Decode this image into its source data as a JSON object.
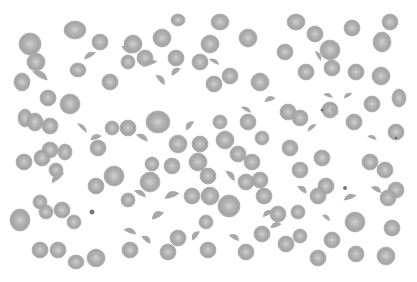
{
  "image": {
    "subject": "blood smear micrograph",
    "width": 417,
    "height": 282,
    "field": {
      "x": 15,
      "y": 14,
      "w": 389,
      "h": 254
    },
    "colors": {
      "background": "#ffffff",
      "cell": "#a8a8a8",
      "cell_edge": "#9a9a9a",
      "pallor": "#cfcfcf",
      "dark_dot": "#555555"
    }
  },
  "cells": [
    [
      30,
      44,
      11,
      11
    ],
    [
      75,
      30,
      11,
      9
    ],
    [
      100,
      42,
      8,
      8
    ],
    [
      133,
      44,
      9,
      9
    ],
    [
      162,
      38,
      9,
      9
    ],
    [
      178,
      20,
      7,
      6
    ],
    [
      210,
      44,
      9,
      9
    ],
    [
      220,
      22,
      9,
      8
    ],
    [
      248,
      38,
      9,
      9
    ],
    [
      296,
      22,
      9,
      8
    ],
    [
      315,
      34,
      8,
      8
    ],
    [
      330,
      50,
      10,
      10
    ],
    [
      352,
      28,
      8,
      8
    ],
    [
      382,
      42,
      9,
      10
    ],
    [
      390,
      22,
      8,
      8
    ],
    [
      22,
      82,
      8,
      9
    ],
    [
      36,
      62,
      9,
      9
    ],
    [
      48,
      98,
      8,
      8
    ],
    [
      78,
      70,
      8,
      7
    ],
    [
      110,
      82,
      8,
      8
    ],
    [
      128,
      62,
      7,
      7
    ],
    [
      145,
      58,
      8,
      8
    ],
    [
      176,
      58,
      8,
      8
    ],
    [
      200,
      62,
      8,
      8
    ],
    [
      214,
      84,
      8,
      8
    ],
    [
      230,
      76,
      8,
      8
    ],
    [
      260,
      82,
      9,
      9
    ],
    [
      285,
      52,
      8,
      8
    ],
    [
      306,
      72,
      8,
      8
    ],
    [
      332,
      68,
      8,
      8
    ],
    [
      356,
      72,
      8,
      8
    ],
    [
      381,
      76,
      9,
      9
    ],
    [
      399,
      98,
      7,
      9
    ],
    [
      70,
      104,
      10,
      10
    ],
    [
      25,
      118,
      7,
      9
    ],
    [
      35,
      122,
      8,
      9
    ],
    [
      50,
      126,
      8,
      8
    ],
    [
      50,
      150,
      8,
      8
    ],
    [
      65,
      152,
      7,
      8
    ],
    [
      98,
      148,
      8,
      8
    ],
    [
      112,
      128,
      7,
      7
    ],
    [
      128,
      128,
      8,
      8
    ],
    [
      158,
      122,
      12,
      11
    ],
    [
      178,
      144,
      9,
      9
    ],
    [
      200,
      144,
      8,
      8
    ],
    [
      220,
      122,
      7,
      7
    ],
    [
      225,
      140,
      9,
      9
    ],
    [
      248,
      122,
      8,
      8
    ],
    [
      262,
      138,
      7,
      7
    ],
    [
      288,
      112,
      8,
      8
    ],
    [
      300,
      118,
      8,
      8
    ],
    [
      330,
      110,
      8,
      8
    ],
    [
      354,
      122,
      8,
      8
    ],
    [
      372,
      104,
      8,
      8
    ],
    [
      396,
      132,
      8,
      8
    ],
    [
      24,
      162,
      8,
      8
    ],
    [
      42,
      158,
      8,
      8
    ],
    [
      56,
      170,
      7,
      7
    ],
    [
      114,
      176,
      10,
      10
    ],
    [
      152,
      164,
      7,
      7
    ],
    [
      172,
      166,
      8,
      8
    ],
    [
      198,
      162,
      9,
      9
    ],
    [
      208,
      176,
      8,
      8
    ],
    [
      238,
      154,
      8,
      8
    ],
    [
      252,
      162,
      8,
      8
    ],
    [
      260,
      180,
      8,
      8
    ],
    [
      290,
      148,
      8,
      8
    ],
    [
      300,
      170,
      8,
      8
    ],
    [
      322,
      158,
      8,
      8
    ],
    [
      326,
      186,
      8,
      8
    ],
    [
      370,
      162,
      8,
      8
    ],
    [
      385,
      170,
      8,
      8
    ],
    [
      396,
      190,
      8,
      8
    ],
    [
      20,
      220,
      10,
      11
    ],
    [
      40,
      202,
      7,
      7
    ],
    [
      46,
      212,
      7,
      7
    ],
    [
      62,
      210,
      8,
      8
    ],
    [
      74,
      222,
      7,
      7
    ],
    [
      96,
      186,
      8,
      8
    ],
    [
      128,
      200,
      7,
      7
    ],
    [
      150,
      182,
      10,
      10
    ],
    [
      192,
      196,
      8,
      8
    ],
    [
      210,
      196,
      9,
      9
    ],
    [
      229,
      206,
      11,
      11
    ],
    [
      246,
      182,
      8,
      8
    ],
    [
      264,
      196,
      8,
      8
    ],
    [
      278,
      214,
      8,
      8
    ],
    [
      298,
      212,
      7,
      7
    ],
    [
      318,
      196,
      8,
      8
    ],
    [
      355,
      222,
      10,
      10
    ],
    [
      388,
      198,
      8,
      8
    ],
    [
      392,
      228,
      8,
      8
    ],
    [
      40,
      250,
      8,
      8
    ],
    [
      58,
      250,
      8,
      8
    ],
    [
      76,
      262,
      8,
      7
    ],
    [
      96,
      258,
      9,
      9
    ],
    [
      130,
      250,
      8,
      8
    ],
    [
      168,
      252,
      8,
      8
    ],
    [
      178,
      238,
      8,
      8
    ],
    [
      206,
      222,
      7,
      7
    ],
    [
      208,
      250,
      8,
      8
    ],
    [
      246,
      252,
      8,
      8
    ],
    [
      262,
      234,
      8,
      8
    ],
    [
      286,
      244,
      8,
      8
    ],
    [
      300,
      236,
      7,
      7
    ],
    [
      318,
      258,
      8,
      8
    ],
    [
      332,
      240,
      8,
      8
    ],
    [
      356,
      254,
      8,
      8
    ],
    [
      386,
      256,
      9,
      9
    ]
  ],
  "fragments": [
    [
      40,
      76,
      9,
      5,
      30
    ],
    [
      90,
      56,
      7,
      4,
      -30
    ],
    [
      126,
      50,
      6,
      4,
      40
    ],
    [
      150,
      64,
      8,
      4,
      -20
    ],
    [
      160,
      80,
      7,
      4,
      50
    ],
    [
      176,
      72,
      6,
      4,
      -40
    ],
    [
      214,
      62,
      6,
      3,
      30
    ],
    [
      270,
      100,
      6,
      4,
      -20
    ],
    [
      318,
      56,
      6,
      3,
      60
    ],
    [
      328,
      96,
      5,
      3,
      20
    ],
    [
      348,
      96,
      5,
      3,
      -30
    ],
    [
      82,
      128,
      7,
      3,
      45
    ],
    [
      96,
      138,
      6,
      4,
      -20
    ],
    [
      142,
      138,
      7,
      4,
      30
    ],
    [
      190,
      126,
      6,
      4,
      -50
    ],
    [
      246,
      110,
      6,
      3,
      30
    ],
    [
      312,
      128,
      6,
      3,
      -40
    ],
    [
      334,
      112,
      5,
      3,
      40
    ],
    [
      372,
      138,
      5,
      3,
      20
    ],
    [
      58,
      178,
      8,
      5,
      -40
    ],
    [
      140,
      194,
      7,
      4,
      30
    ],
    [
      172,
      196,
      8,
      5,
      -20
    ],
    [
      230,
      176,
      7,
      4,
      50
    ],
    [
      268,
      214,
      6,
      4,
      -30
    ],
    [
      302,
      190,
      6,
      4,
      40
    ],
    [
      350,
      198,
      7,
      4,
      -20
    ],
    [
      376,
      190,
      6,
      4,
      30
    ],
    [
      130,
      232,
      7,
      4,
      20
    ],
    [
      158,
      216,
      7,
      5,
      -30
    ],
    [
      146,
      240,
      6,
      4,
      40
    ],
    [
      196,
      236,
      6,
      4,
      -50
    ],
    [
      234,
      238,
      6,
      4,
      30
    ],
    [
      276,
      226,
      6,
      4,
      -20
    ],
    [
      326,
      218,
      5,
      3,
      40
    ]
  ],
  "specks": [
    [
      92,
      212,
      2.5
    ],
    [
      345,
      188,
      2
    ],
    [
      322,
      110,
      1.5
    ],
    [
      396,
      138,
      1.2
    ]
  ]
}
